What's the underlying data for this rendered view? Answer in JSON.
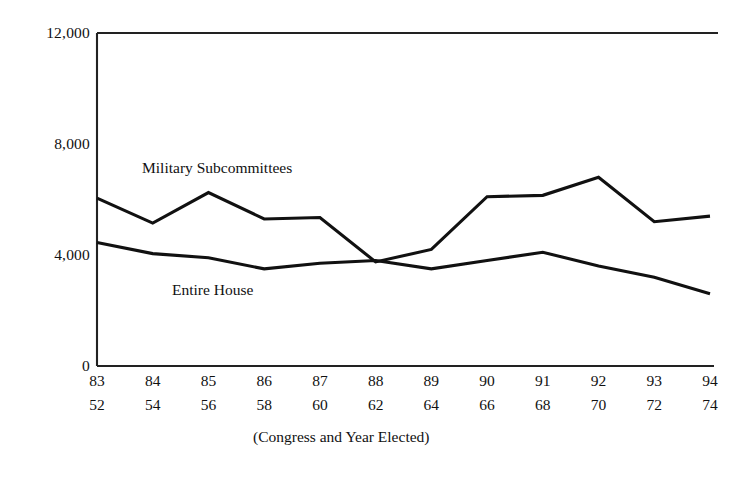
{
  "chart_data": {
    "type": "line",
    "title": "",
    "subtitle": "",
    "xlabel": "(Congress and Year Elected)",
    "ylabel": "",
    "grid": false,
    "legend_position": "inline-labels",
    "ylim": [
      0,
      12000
    ],
    "yticks": [
      0,
      4000,
      8000,
      12000
    ],
    "ytick_labels": [
      "0",
      "4,000",
      "8,000",
      "12,000"
    ],
    "categories": [
      "83",
      "84",
      "85",
      "86",
      "87",
      "88",
      "89",
      "90",
      "91",
      "92",
      "93",
      "94"
    ],
    "x_secondary_label": "Year Elected",
    "x_secondary": [
      "52",
      "54",
      "56",
      "58",
      "60",
      "62",
      "64",
      "66",
      "68",
      "70",
      "72",
      "74"
    ],
    "series": [
      {
        "name": "Military Subcommittees",
        "values": [
          6050,
          5150,
          6250,
          5300,
          5350,
          3750,
          4200,
          6100,
          6150,
          6800,
          5200,
          5400
        ]
      },
      {
        "name": "Entire House",
        "values": [
          4450,
          4050,
          3900,
          3500,
          3700,
          3800,
          3500,
          3800,
          4100,
          3600,
          3200,
          2600
        ]
      }
    ]
  },
  "labels": {
    "military": "Military Subcommittees",
    "entire_house": "Entire House",
    "caption": "(Congress and Year Elected)"
  },
  "axis": {
    "y_12000": "12,000",
    "y_8000": "8,000",
    "y_4000": "4,000",
    "y_0": "0"
  },
  "colors": {
    "line": "#111111",
    "frame": "#222222",
    "background": "#ffffff"
  }
}
